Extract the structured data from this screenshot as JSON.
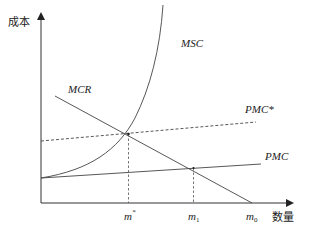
{
  "diagram": {
    "axes": {
      "y_label": "成本",
      "x_label": "数量"
    },
    "curves": {
      "msc": "MSC",
      "mcr": "MCR",
      "pmc_star": "PMC*",
      "pmc": "PMC"
    },
    "x_ticks": {
      "m_star": "m",
      "m_star_sup": "*",
      "m1": "m",
      "m1_sub": "1",
      "m0": "m",
      "m0_sub": "0"
    }
  }
}
